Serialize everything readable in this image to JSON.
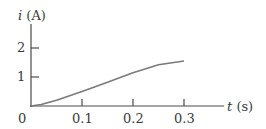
{
  "chart_data": {
    "type": "line",
    "title": "",
    "xlabel": "t (s)",
    "ylabel": "i (A)",
    "xlabel_var": "t",
    "xlabel_unit": "(s)",
    "ylabel_var": "i",
    "ylabel_unit": "(A)",
    "origin_label": "0",
    "x_ticks": [
      0.1,
      0.2,
      0.3
    ],
    "x_tick_labels": [
      "0.1",
      "0.2",
      "0.3"
    ],
    "y_ticks": [
      1,
      2
    ],
    "y_tick_labels": [
      "1",
      "2"
    ],
    "xlim": [
      0,
      0.4
    ],
    "ylim": [
      0,
      2.6
    ],
    "grid": false,
    "legend": null,
    "series": [
      {
        "name": "i(t)",
        "x": [
          0,
          0.02,
          0.05,
          0.1,
          0.15,
          0.2,
          0.25,
          0.3
        ],
        "y": [
          0,
          0.05,
          0.2,
          0.5,
          0.82,
          1.15,
          1.42,
          1.55
        ]
      }
    ],
    "colors": {
      "axis": "#4a4a4a",
      "curve": "#7a7a7a",
      "text": "#3a3a3a"
    }
  }
}
